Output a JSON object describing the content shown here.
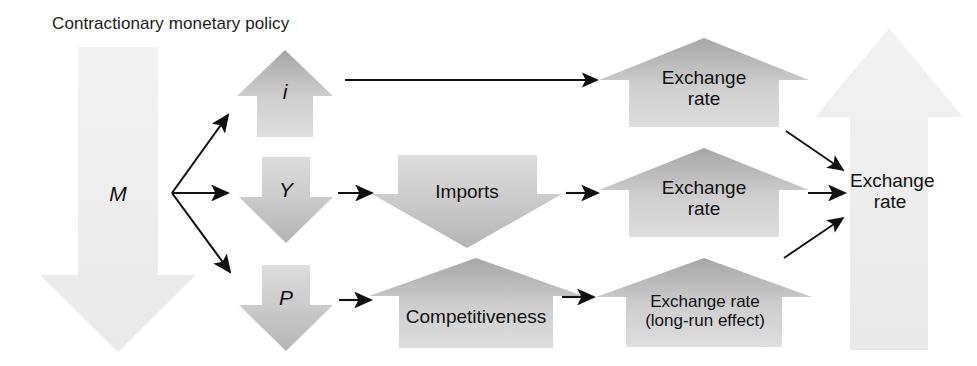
{
  "diagram": {
    "title": "Contractionary monetary policy",
    "background_color": "#ffffff",
    "text_color": "#111111"
  },
  "nodes": {
    "money_supply": {
      "label": "M",
      "direction": "down",
      "shape": "large-down-arrow",
      "fill_light": "#eeeeee",
      "fill_dark": "#e4e4e4"
    },
    "interest_rate": {
      "label": "i",
      "direction": "up",
      "shape": "up-arrow",
      "fill_light": "#dcdcdc",
      "fill_dark": "#b4b4b4"
    },
    "output": {
      "label": "Y",
      "direction": "down",
      "shape": "down-arrow",
      "fill_light": "#d4d4d4",
      "fill_dark": "#bdbdbd"
    },
    "price_level": {
      "label": "P",
      "direction": "down",
      "shape": "down-arrow",
      "fill_light": "#d6d6d6",
      "fill_dark": "#bebebe"
    },
    "imports": {
      "label": "Imports",
      "direction": "down",
      "shape": "down-arrow-wide",
      "fill_light": "#d0d0d0",
      "fill_dark": "#bcbcbc"
    },
    "competitiveness": {
      "label": "Competitiveness",
      "direction": "up",
      "shape": "up-arrow-wide",
      "fill_light": "#d8d8d8",
      "fill_dark": "#b0b0b0"
    },
    "exchange_rate_1": {
      "label": "Exchange\nrate",
      "direction": "up",
      "shape": "up-arrow-wide",
      "fill_light": "#d8d8d8",
      "fill_dark": "#a9a9a9"
    },
    "exchange_rate_2": {
      "label": "Exchange\nrate",
      "direction": "up",
      "shape": "up-arrow-wide",
      "fill_light": "#d8d8d8",
      "fill_dark": "#a9a9a9"
    },
    "exchange_rate_long_run": {
      "label": "Exchange rate\n(long-run effect)",
      "direction": "up",
      "shape": "up-arrow-wide",
      "fill_light": "#d8d8d8",
      "fill_dark": "#a9a9a9"
    },
    "exchange_rate_total": {
      "label": "Exchange\nrate",
      "direction": "up",
      "shape": "large-up-arrow",
      "fill_light": "#eeeeee",
      "fill_dark": "#e6e6e6"
    }
  },
  "connectors": [
    {
      "name": "m-to-i",
      "from": "money_supply",
      "to": "interest_rate",
      "style": "diagonal-up"
    },
    {
      "name": "m-to-y",
      "from": "money_supply",
      "to": "output",
      "style": "horizontal"
    },
    {
      "name": "m-to-p",
      "from": "money_supply",
      "to": "price_level",
      "style": "diagonal-down"
    },
    {
      "name": "i-to-exchange-rate-1",
      "from": "interest_rate",
      "to": "exchange_rate_1",
      "style": "horizontal-long"
    },
    {
      "name": "y-to-imports",
      "from": "output",
      "to": "imports",
      "style": "horizontal"
    },
    {
      "name": "imports-to-exchange-rate-2",
      "from": "imports",
      "to": "exchange_rate_2",
      "style": "horizontal"
    },
    {
      "name": "p-to-competitiveness",
      "from": "price_level",
      "to": "competitiveness",
      "style": "horizontal"
    },
    {
      "name": "competitiveness-to-exchange-rate-long-run",
      "from": "competitiveness",
      "to": "exchange_rate_long_run",
      "style": "horizontal"
    },
    {
      "name": "exchange-rate-1-to-total",
      "from": "exchange_rate_1",
      "to": "exchange_rate_total",
      "style": "diagonal-down"
    },
    {
      "name": "exchange-rate-2-to-total",
      "from": "exchange_rate_2",
      "to": "exchange_rate_total",
      "style": "horizontal"
    },
    {
      "name": "exchange-rate-long-run-to-total",
      "from": "exchange_rate_long_run",
      "to": "exchange_rate_total",
      "style": "diagonal-up"
    }
  ]
}
